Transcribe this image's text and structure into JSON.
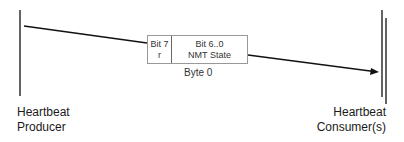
{
  "diagram": {
    "producer": {
      "line1": "Heartbeat",
      "line2": "Producer"
    },
    "consumer": {
      "line1": "Heartbeat",
      "line2": "Consumer(s)"
    },
    "message": {
      "fields": [
        {
          "title": "Bit 7",
          "value": "r"
        },
        {
          "title": "Bit 6..0",
          "value": "NMT State"
        }
      ],
      "byte_label": "Byte 0"
    }
  }
}
